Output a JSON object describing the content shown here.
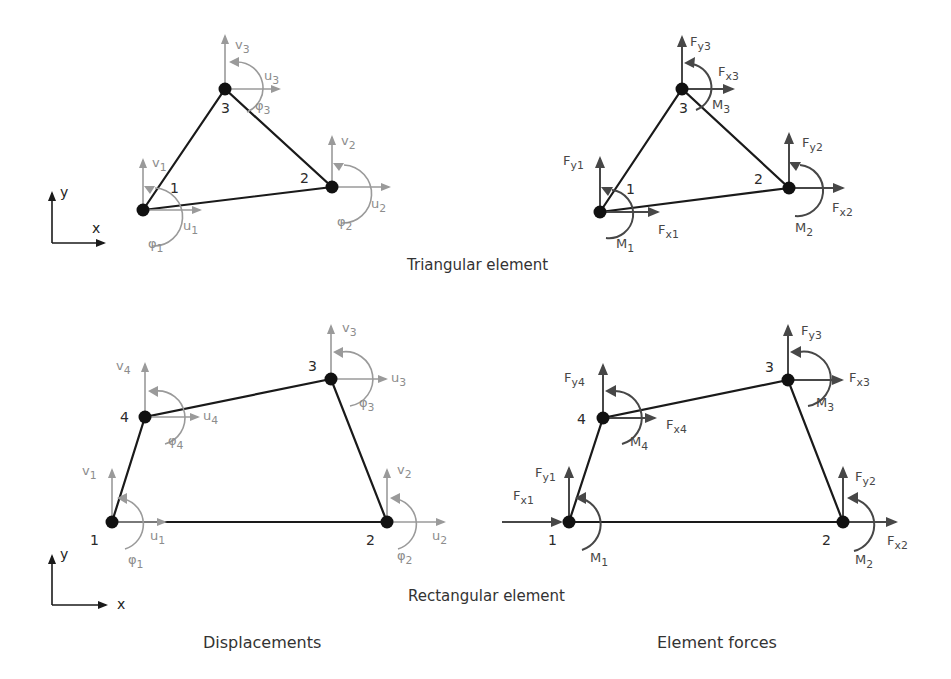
{
  "figure": {
    "captions": {
      "triangular": "Triangular element",
      "rectangular": "Rectangular element"
    },
    "columns": {
      "left": "Displacements",
      "right": "Element forces"
    },
    "axes": {
      "x": "x",
      "y": "y"
    }
  },
  "colors": {
    "element_edge": "#1a1a1a",
    "node": "#111111",
    "displacement_arrow": "#9a9a9a",
    "displacement_label": "#8c8c8c",
    "force_arrow": "#474747",
    "force_label": "#474747",
    "node_label": "#2a2a2a"
  },
  "triangle_displacements": {
    "nodes": [
      {
        "id": "1",
        "x": 143,
        "y": 210,
        "u": "u1",
        "v": "v1",
        "phi": "φ1"
      },
      {
        "id": "2",
        "x": 332,
        "y": 187,
        "u": "u2",
        "v": "v2",
        "phi": "φ2"
      },
      {
        "id": "3",
        "x": 225,
        "y": 89,
        "u": "u3",
        "v": "v3",
        "phi": "φ3"
      }
    ]
  },
  "triangle_forces": {
    "nodes": [
      {
        "id": "1",
        "x": 600,
        "y": 212,
        "fx": "Fx1",
        "fy": "Fy1",
        "m": "M1"
      },
      {
        "id": "2",
        "x": 789,
        "y": 188,
        "fx": "Fx2",
        "fy": "Fy2",
        "m": "M2"
      },
      {
        "id": "3",
        "x": 682,
        "y": 89,
        "fx": "Fx3",
        "fy": "Fy3",
        "m": "M3"
      }
    ]
  },
  "quad_displacements": {
    "nodes": [
      {
        "id": "1",
        "x": 112,
        "y": 522,
        "u": "u1",
        "v": "v1",
        "phi": "φ1"
      },
      {
        "id": "2",
        "x": 387,
        "y": 522,
        "u": "u2",
        "v": "v2",
        "phi": "φ2"
      },
      {
        "id": "3",
        "x": 331,
        "y": 379,
        "u": "u3",
        "v": "v3",
        "phi": "φ3"
      },
      {
        "id": "4",
        "x": 145,
        "y": 417,
        "u": "u4",
        "v": "v4",
        "phi": "φ4"
      }
    ]
  },
  "quad_forces": {
    "nodes": [
      {
        "id": "1",
        "x": 569,
        "y": 522,
        "fx": "Fx1",
        "fy": "Fy1",
        "m": "M1"
      },
      {
        "id": "2",
        "x": 843,
        "y": 522,
        "fx": "Fx2",
        "fy": "Fy2",
        "m": "M2"
      },
      {
        "id": "3",
        "x": 788,
        "y": 380,
        "fx": "Fx3",
        "fy": "Fy3",
        "m": "M3"
      },
      {
        "id": "4",
        "x": 603,
        "y": 418,
        "fx": "Fx4",
        "fy": "Fy4",
        "m": "M4"
      }
    ]
  }
}
